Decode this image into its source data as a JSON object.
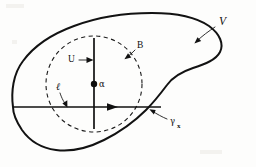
{
  "figure": {
    "background_color": "#fdfdfc",
    "ink_color": "#111111",
    "labels": {
      "outer_region": "V",
      "circle_boundary": "B",
      "velocity": "U",
      "center_point": "α",
      "radius_segment": "ℓ",
      "boundary_curve": "γ",
      "boundary_curve_subscript": "x"
    },
    "annotations": [
      {
        "name": "outer-region-label",
        "text": "V",
        "x": 224,
        "y": 22
      },
      {
        "name": "circle-boundary-label",
        "text": "B",
        "x": 141,
        "y": 46
      },
      {
        "name": "velocity-label",
        "text": "U",
        "x": 72,
        "y": 60
      },
      {
        "name": "center-point-label",
        "text": "α",
        "x": 102,
        "y": 84
      },
      {
        "name": "radius-label",
        "text": "ℓ",
        "x": 59,
        "y": 89
      },
      {
        "name": "boundary-curve-label",
        "text": "γ",
        "x": 173,
        "y": 122
      }
    ],
    "geometry": {
      "circle_center_x": 94,
      "circle_center_y": 84,
      "circle_radius": 48,
      "vertical_axis_top_y": 38,
      "vertical_axis_bottom_y": 129,
      "horizontal_axis_left_x": 13,
      "horizontal_axis_right_x": 161,
      "horizontal_axis_y": 107
    }
  }
}
